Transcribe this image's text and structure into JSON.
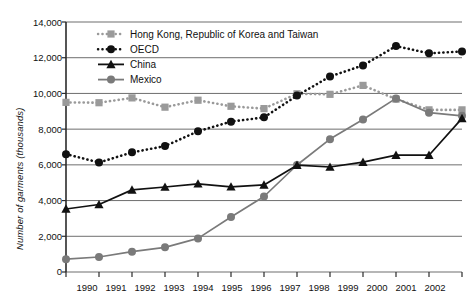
{
  "chart_data": {
    "type": "line",
    "title": "",
    "xlabel": "",
    "ylabel": "Number of garments (thousands)",
    "categories": [
      "1990",
      "1991",
      "1992",
      "1993",
      "1994",
      "1995",
      "1996",
      "1997",
      "1998",
      "1999",
      "2000",
      "2001",
      "2002"
    ],
    "x": [
      1990,
      1991,
      1992,
      1993,
      1994,
      1995,
      1996,
      1997,
      1998,
      1999,
      2000,
      2001,
      2002
    ],
    "ylim": [
      0,
      14000
    ],
    "ytick_values": [
      0,
      2000,
      4000,
      6000,
      8000,
      10000,
      12000,
      14000
    ],
    "ytick_labels": [
      "0",
      "2,000",
      "4,000",
      "6,000",
      "8,000",
      "10,000",
      "12,000",
      "14,000"
    ],
    "grid": true,
    "legend_position": "top-left inside plot",
    "series": [
      {
        "name": "Hong Kong, Republic of Korea and Taiwan",
        "marker": "square",
        "color": "#9a9a9a",
        "linestyle": "dotted",
        "values": [
          9500,
          9480,
          9750,
          9230,
          9620,
          9280,
          9150,
          9980,
          9950,
          10450,
          9680,
          9080,
          9080
        ]
      },
      {
        "name": "OECD",
        "marker": "circle",
        "color": "#111111",
        "linestyle": "dotted",
        "values": [
          6600,
          6130,
          6700,
          7050,
          7880,
          8420,
          8660,
          9880,
          10950,
          11570,
          12650,
          12250,
          12350
        ]
      },
      {
        "name": "China",
        "marker": "triangle",
        "color": "#111111",
        "linestyle": "solid",
        "values": [
          3530,
          3780,
          4600,
          4760,
          4940,
          4770,
          4880,
          5980,
          5880,
          6150,
          6540,
          6540,
          8600
        ]
      },
      {
        "name": "Mexico",
        "marker": "circle",
        "color": "#7a7a7a",
        "linestyle": "solid",
        "values": [
          720,
          840,
          1140,
          1380,
          1880,
          3080,
          4230,
          5990,
          7440,
          8540,
          9720,
          8920,
          8750
        ]
      }
    ]
  },
  "legend": {
    "items": [
      {
        "label": "Hong Kong, Republic of Korea and Taiwan"
      },
      {
        "label": "OECD"
      },
      {
        "label": "China"
      },
      {
        "label": "Mexico"
      }
    ]
  },
  "axes": {
    "y_title": "Number of garments (thousands)",
    "y_labels": [
      "14,000",
      "12,000",
      "10,000",
      "8,000",
      "6,000",
      "4,000",
      "2,000",
      "0"
    ],
    "x_labels": [
      "1990",
      "1991",
      "1992",
      "1993",
      "1994",
      "1995",
      "1996",
      "1997",
      "1998",
      "1999",
      "2000",
      "2001",
      "2002"
    ]
  },
  "colors": {
    "gray_series": "#9a9a9a",
    "mexico_gray": "#7a7a7a",
    "black_series": "#111111",
    "gridline": "#6e6e6e",
    "axis": "#2b2b2b",
    "background": "#ffffff"
  }
}
